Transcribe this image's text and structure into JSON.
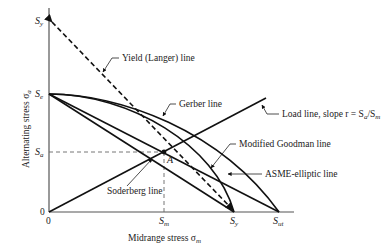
{
  "diagram": {
    "type": "fatigue-failure-criteria",
    "axes": {
      "x_label": "Midrange stress σ",
      "x_label_sub": "m",
      "y_label": "Alternating stress σ",
      "y_label_sub": "a",
      "origin_x_label": "0",
      "origin_y_label": "0"
    },
    "x_ticks": [
      {
        "main": "S",
        "sub": "m"
      },
      {
        "main": "S",
        "sub": "y"
      },
      {
        "main": "S",
        "sub": "ut"
      }
    ],
    "y_ticks": [
      {
        "main": "S",
        "sub": "y"
      },
      {
        "main": "S",
        "sub": "e"
      },
      {
        "main": "S",
        "sub": "a"
      }
    ],
    "point_label": "A",
    "curves": [
      {
        "name": "Yield (Langer) line",
        "style": "dashed",
        "from": "S_y (σa)",
        "to": "S_y (σm)"
      },
      {
        "name": "Gerber line",
        "style": "solid",
        "shape": "parabola",
        "from": "S_e",
        "to": "S_ut"
      },
      {
        "name": "ASME-elliptic line",
        "style": "solid",
        "shape": "ellipse",
        "from": "S_e",
        "to": "S_y"
      },
      {
        "name": "Modified Goodman line",
        "style": "solid",
        "shape": "straight",
        "from": "S_e",
        "to": "S_ut"
      },
      {
        "name": "Soderberg line",
        "style": "solid",
        "shape": "straight",
        "from": "S_e",
        "to": "S_y"
      },
      {
        "name": "Load line",
        "style": "solid",
        "from": "origin",
        "through": "A"
      }
    ],
    "labels": {
      "yield": "Yield (Langer) line",
      "gerber": "Gerber line",
      "load": "Load line, slope r = S",
      "load_sub_a": "a",
      "load_slash": "/S",
      "load_sub_m": "m",
      "goodman": "Modified Goodman line",
      "asme": "ASME-elliptic line",
      "soderberg": "Soderberg line"
    }
  }
}
